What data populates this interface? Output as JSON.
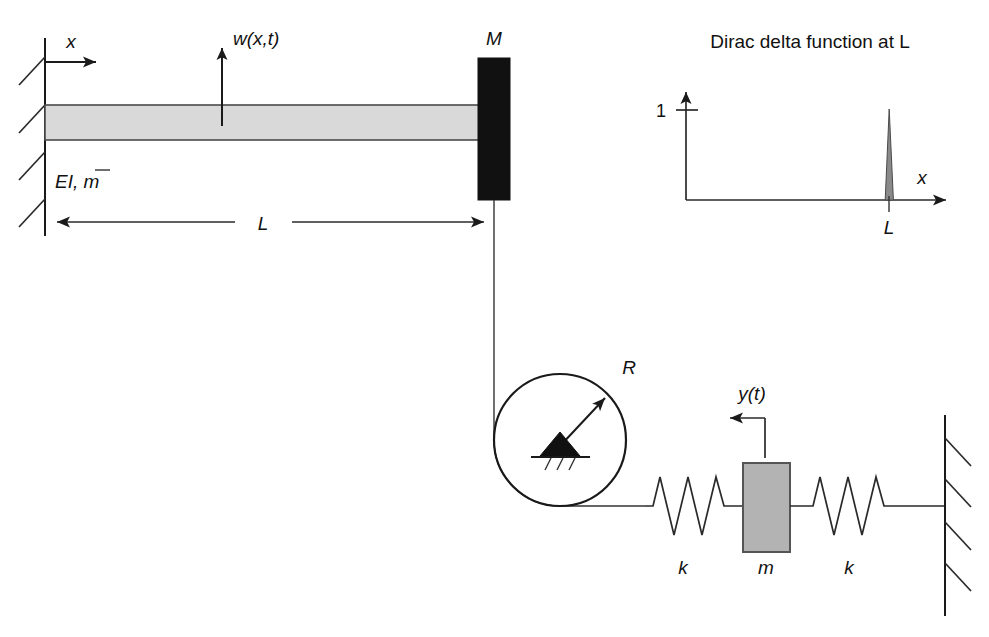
{
  "figure": {
    "name": "cantilever-beam-pulley-spring-mass-diagram",
    "background_color": "#ffffff",
    "line_color": "#1a1a1a"
  },
  "beam_system": {
    "axis_label_x": "x",
    "transverse_displacement_label": "w(x,t)",
    "beam_properties_label": "EI, m̄",
    "beam_properties_parts": {
      "flexural": "EI",
      "separator": ", ",
      "mass_per_length": "m",
      "overbar": true
    },
    "tip_mass_label": "M",
    "length_dimension_label": "L",
    "beam_fill_color": "#d9d9d9",
    "tip_mass_fill_color": "#111111",
    "support_type": "fixed-wall-hatched",
    "support_hatch_count": 4
  },
  "pulley": {
    "radius_label": "R",
    "pivot_type": "pinned-ground-triangle",
    "ground_hatch_count": 3
  },
  "spring_mass_system": {
    "displacement_label": "y(t)",
    "left_spring_label": "k",
    "right_spring_label": "k",
    "mass_label": "m",
    "mass_fill_color": "#b3b3b3",
    "wall_hatch_count": 4,
    "spring_coil_count": 3
  },
  "dirac_plot": {
    "title": "Dirac delta function at L",
    "y_tick_label": "1",
    "x_axis_label": "x",
    "impulse_location_label": "L",
    "spike_fill_color": "#8a8a8a"
  }
}
